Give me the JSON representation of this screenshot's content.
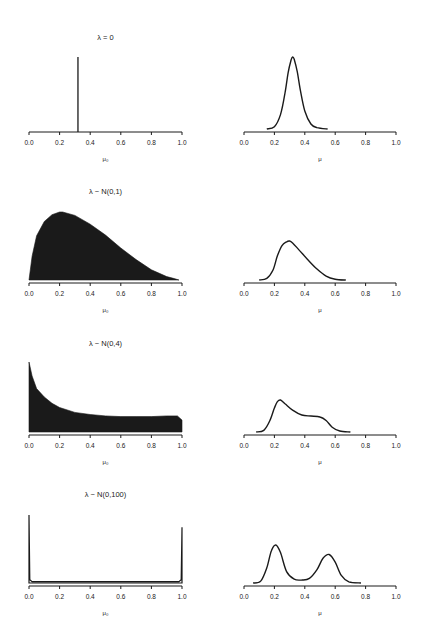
{
  "chart_data": [
    {
      "type": "bar",
      "panel": "row1-left",
      "title": "λ = 0",
      "xlabel": "μ₀",
      "ylabel": "",
      "xlim": [
        0,
        1
      ],
      "xticks": [
        "0.0",
        "0.2",
        "0.4",
        "0.6",
        "0.8",
        "1.0"
      ],
      "description": "Point mass (single spike) at μ₀ ≈ 0.32",
      "x": [
        0.32
      ],
      "values": [
        1.0
      ]
    },
    {
      "type": "line",
      "panel": "row1-right",
      "title": "",
      "xlabel": "μ",
      "ylabel": "",
      "xlim": [
        0,
        1
      ],
      "xticks": [
        "0.0",
        "0.2",
        "0.4",
        "0.6",
        "0.8",
        "1.0"
      ],
      "description": "Unimodal density peaked at μ ≈ 0.32",
      "x": [
        0.15,
        0.2,
        0.24,
        0.27,
        0.29,
        0.31,
        0.32,
        0.33,
        0.35,
        0.37,
        0.4,
        0.44,
        0.48,
        0.55
      ],
      "values": [
        0.0,
        0.03,
        0.2,
        0.5,
        0.78,
        0.96,
        1.0,
        0.97,
        0.8,
        0.55,
        0.25,
        0.07,
        0.02,
        0.0
      ]
    },
    {
      "type": "area",
      "panel": "row2-left",
      "title": "λ ~ N(0,1)",
      "xlabel": "μ₀",
      "ylabel": "",
      "xlim": [
        0,
        1
      ],
      "xticks": [
        "0.0",
        "0.2",
        "0.4",
        "0.6",
        "0.8",
        "1.0"
      ],
      "description": "Filled histogram, right-skewed, peak near 0.21",
      "x": [
        0.0,
        0.02,
        0.05,
        0.1,
        0.15,
        0.2,
        0.22,
        0.3,
        0.4,
        0.5,
        0.6,
        0.7,
        0.8,
        0.9,
        0.95,
        0.98
      ],
      "values": [
        0.0,
        0.35,
        0.65,
        0.86,
        0.96,
        1.0,
        1.0,
        0.95,
        0.82,
        0.66,
        0.47,
        0.3,
        0.15,
        0.05,
        0.02,
        0.0
      ]
    },
    {
      "type": "line",
      "panel": "row2-right",
      "title": "",
      "xlabel": "μ",
      "ylabel": "",
      "xlim": [
        0,
        1
      ],
      "xticks": [
        "0.0",
        "0.2",
        "0.4",
        "0.6",
        "0.8",
        "1.0"
      ],
      "description": "Right-skewed density, peak near μ ≈ 0.30",
      "x": [
        0.1,
        0.15,
        0.19,
        0.22,
        0.25,
        0.28,
        0.3,
        0.32,
        0.36,
        0.42,
        0.48,
        0.54,
        0.6,
        0.67
      ],
      "values": [
        0.0,
        0.04,
        0.25,
        0.62,
        0.88,
        0.98,
        1.0,
        0.95,
        0.78,
        0.52,
        0.28,
        0.1,
        0.02,
        0.0
      ]
    },
    {
      "type": "area",
      "panel": "row3-left",
      "title": "λ ~ N(0,4)",
      "xlabel": "μ₀",
      "ylabel": "",
      "xlim": [
        0,
        1
      ],
      "xticks": [
        "0.0",
        "0.2",
        "0.4",
        "0.6",
        "0.8",
        "1.0"
      ],
      "description": "Filled histogram, sharp spike at 0 decaying to a flat plateau up to 1.0",
      "x": [
        0.0,
        0.02,
        0.05,
        0.1,
        0.15,
        0.2,
        0.3,
        0.4,
        0.5,
        0.6,
        0.7,
        0.8,
        0.9,
        0.97,
        1.0
      ],
      "values": [
        1.0,
        0.8,
        0.62,
        0.5,
        0.41,
        0.35,
        0.28,
        0.25,
        0.23,
        0.22,
        0.22,
        0.22,
        0.23,
        0.23,
        0.17
      ]
    },
    {
      "type": "line",
      "panel": "row3-right",
      "title": "",
      "xlabel": "μ",
      "ylabel": "",
      "xlim": [
        0,
        1
      ],
      "xticks": [
        "0.0",
        "0.2",
        "0.4",
        "0.6",
        "0.8",
        "1.0"
      ],
      "description": "Density with peak at μ ≈ 0.24 and shoulder around 0.45–0.52",
      "x": [
        0.08,
        0.13,
        0.17,
        0.2,
        0.22,
        0.24,
        0.27,
        0.32,
        0.38,
        0.44,
        0.5,
        0.54,
        0.58,
        0.63,
        0.7
      ],
      "values": [
        0.0,
        0.05,
        0.35,
        0.75,
        0.95,
        1.0,
        0.88,
        0.68,
        0.53,
        0.5,
        0.47,
        0.36,
        0.15,
        0.03,
        0.0
      ]
    },
    {
      "type": "area",
      "panel": "row4-left",
      "title": "λ ~ N(0,100)",
      "xlabel": "μ₀",
      "ylabel": "",
      "xlim": [
        0,
        1
      ],
      "xticks": [
        "0.0",
        "0.2",
        "0.4",
        "0.6",
        "0.8",
        "1.0"
      ],
      "description": "Mass concentrated at the boundaries 0 and 1, near-zero in between",
      "x": [
        0.0,
        0.005,
        0.02,
        0.5,
        0.98,
        0.995,
        1.0
      ],
      "values": [
        1.0,
        0.05,
        0.02,
        0.02,
        0.02,
        0.05,
        0.82
      ]
    },
    {
      "type": "line",
      "panel": "row4-right",
      "title": "",
      "xlabel": "μ",
      "ylabel": "",
      "xlim": [
        0,
        1
      ],
      "xticks": [
        "0.0",
        "0.2",
        "0.4",
        "0.6",
        "0.8",
        "1.0"
      ],
      "description": "Bimodal density, peaks at μ ≈ 0.21 and μ ≈ 0.56",
      "x": [
        0.06,
        0.11,
        0.15,
        0.18,
        0.21,
        0.24,
        0.28,
        0.33,
        0.38,
        0.43,
        0.48,
        0.52,
        0.56,
        0.6,
        0.64,
        0.69,
        0.77
      ],
      "values": [
        0.0,
        0.05,
        0.4,
        0.85,
        1.0,
        0.8,
        0.3,
        0.1,
        0.08,
        0.12,
        0.35,
        0.65,
        0.75,
        0.55,
        0.2,
        0.03,
        0.0
      ]
    }
  ],
  "layout": {
    "rows": [
      {
        "axis_y": 132,
        "peak_y": 57
      },
      {
        "axis_y": 283,
        "peak_y": 212
      },
      {
        "axis_y": 435,
        "peak_y": 362
      },
      {
        "axis_y": 586,
        "peak_y": 515
      }
    ],
    "right_peak_y": [
      57,
      241,
      400,
      545
    ],
    "left_x": [
      29,
      182
    ],
    "right_x": [
      244,
      396
    ],
    "ink_color": "#1a1a1a"
  }
}
